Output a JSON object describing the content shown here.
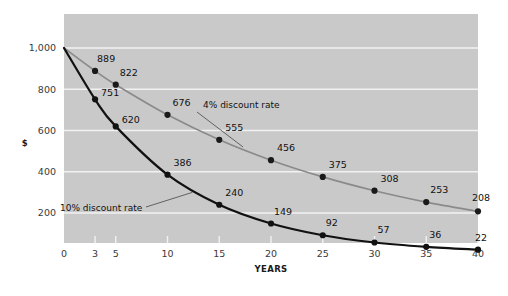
{
  "chart_data": {
    "type": "line",
    "title": "",
    "xlabel": "YEARS",
    "ylabel": "$",
    "x": [
      0,
      3,
      5,
      10,
      15,
      20,
      25,
      30,
      35,
      40
    ],
    "xticklabels": [
      "0",
      "3",
      "5",
      "10",
      "15",
      "20",
      "25",
      "30",
      "35",
      "40"
    ],
    "xlim": [
      0,
      40
    ],
    "ylim": [
      0,
      1100
    ],
    "yticks": [
      200,
      400,
      600,
      800,
      1000
    ],
    "yticklabels": [
      "200",
      "400",
      "600",
      "800",
      "1,000"
    ],
    "grid": "horizontal",
    "legend_position": "inline-annotations",
    "plot_background": "#c9c9c9",
    "gridline_color": "#f2f2f2",
    "series": [
      {
        "name": "4% discount rate",
        "color": "#8a8a8a",
        "marker_color": "#1a1a1a",
        "values": [
          1000,
          889,
          822,
          676,
          555,
          456,
          375,
          308,
          253,
          208
        ],
        "point_labels": [
          "",
          "889",
          "822",
          "676",
          "555",
          "456",
          "375",
          "308",
          "253",
          "208"
        ],
        "annotation": "4% discount rate"
      },
      {
        "name": "10% discount rate",
        "color": "#111111",
        "marker_color": "#111111",
        "values": [
          1000,
          751,
          620,
          386,
          240,
          149,
          92,
          57,
          36,
          22
        ],
        "point_labels": [
          "",
          "751",
          "620",
          "386",
          "240",
          "149",
          "92",
          "57",
          "36",
          "22"
        ],
        "annotation": "10% discount rate"
      }
    ],
    "annotations": [
      {
        "text": "4% discount rate",
        "series": "4% discount rate",
        "anchor_x": 15
      },
      {
        "text": "10% discount rate",
        "series": "10% discount rate",
        "anchor_x": 12.5
      }
    ]
  }
}
